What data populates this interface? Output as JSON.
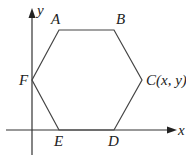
{
  "diagram": {
    "type": "coordinate-geometry",
    "shape": "hexagon",
    "axes": {
      "x_label": "x",
      "y_label": "y"
    },
    "vertices": [
      {
        "name": "A",
        "label": "A"
      },
      {
        "name": "B",
        "label": "B"
      },
      {
        "name": "C",
        "label": "C(x, y)"
      },
      {
        "name": "D",
        "label": "D"
      },
      {
        "name": "E",
        "label": "E"
      },
      {
        "name": "F",
        "label": "F"
      }
    ]
  }
}
